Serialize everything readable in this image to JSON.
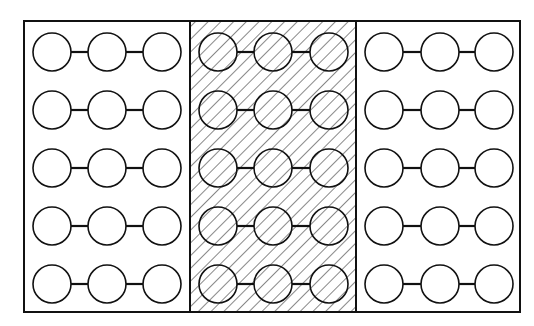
{
  "diagram": {
    "panels": [
      {
        "name": "left",
        "hatched": false,
        "rows": 5,
        "chain_length": 3
      },
      {
        "name": "middle",
        "hatched": true,
        "rows": 5,
        "chain_length": 3
      },
      {
        "name": "right",
        "hatched": false,
        "rows": 5,
        "chain_length": 3
      }
    ],
    "colors": {
      "stroke": "#111111",
      "background": "#ffffff",
      "hatch": "#555555"
    }
  }
}
